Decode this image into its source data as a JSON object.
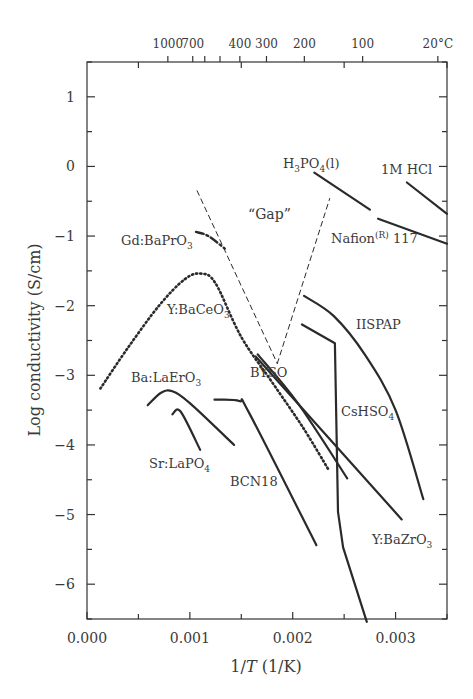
{
  "chart_data": {
    "type": "line",
    "title": "",
    "xlabel": "1/T (1/K)",
    "ylabel": "Log conductivity (S/cm)",
    "xlim": [
      0.0,
      0.0035
    ],
    "ylim": [
      -6.5,
      1.5
    ],
    "x_ticks": [
      "0.000",
      "0.001",
      "0.002",
      "0.003"
    ],
    "x_tick_values": [
      0.0,
      0.001,
      0.002,
      0.003
    ],
    "y_ticks": [
      "1",
      "0",
      "−1",
      "−2",
      "−3",
      "−4",
      "−5",
      "−6"
    ],
    "y_tick_values": [
      1,
      0,
      -1,
      -2,
      -3,
      -4,
      -5,
      -6
    ],
    "top_axis": {
      "label_unit": "°C",
      "ticks": [
        {
          "label": "1000",
          "x": 0.000786
        },
        {
          "label": "700",
          "x": 0.001028
        },
        {
          "label": "",
          "x": 0.001145
        },
        {
          "label": "",
          "x": 0.001293
        },
        {
          "label": "400",
          "x": 0.001486
        },
        {
          "label": "300",
          "x": 0.001745
        },
        {
          "label": "200",
          "x": 0.002113
        },
        {
          "label": "100",
          "x": 0.00268
        },
        {
          "label": "20°C",
          "x": 0.003411
        }
      ]
    },
    "grid": false,
    "legend": "none (inline labels)",
    "series": [
      {
        "name": "1M HCl",
        "style": "solid",
        "x": [
          0.00311,
          0.0035
        ],
        "y": [
          -0.23,
          -0.68
        ]
      },
      {
        "name": "H3PO4(l)",
        "style": "solid",
        "x": [
          0.00221,
          0.00275
        ],
        "y": [
          -0.09,
          -0.62
        ]
      },
      {
        "name": "Nafion(R) 117",
        "style": "solid",
        "x": [
          0.00283,
          0.0035
        ],
        "y": [
          -0.75,
          -1.11
        ]
      },
      {
        "name": "Gd:BaPrO3",
        "style": "dashdot",
        "x": [
          0.00106,
          0.00118,
          0.00134
        ],
        "y": [
          -0.94,
          -1.0,
          -1.18
        ]
      },
      {
        "name": "Y:BaCeO3",
        "style": "dotted",
        "x": [
          0.00013,
          0.0004,
          0.0007,
          0.00095,
          0.00111,
          0.00125,
          0.0015,
          0.0018,
          0.0021,
          0.00235
        ],
        "y": [
          -3.19,
          -2.6,
          -2.0,
          -1.62,
          -1.54,
          -1.68,
          -2.45,
          -3.1,
          -3.75,
          -4.36
        ]
      },
      {
        "name": "Gap boundary (left)",
        "style": "dashed",
        "x": [
          0.00107,
          0.00185
        ],
        "y": [
          -0.35,
          -2.83
        ]
      },
      {
        "name": "Gap boundary (right)",
        "style": "dashed",
        "x": [
          0.00185,
          0.00236
        ],
        "y": [
          -2.83,
          -0.46
        ]
      },
      {
        "name": "IISPAP",
        "style": "solid",
        "x": [
          0.00211,
          0.0024,
          0.0027,
          0.003,
          0.00327
        ],
        "y": [
          -1.86,
          -2.15,
          -2.7,
          -3.5,
          -4.78
        ]
      },
      {
        "name": "CsHSO4",
        "style": "solid",
        "x": [
          0.00209,
          0.00241,
          0.00244,
          0.00249,
          0.00272
        ],
        "y": [
          -2.27,
          -2.54,
          -4.96,
          -5.47,
          -6.54
        ]
      },
      {
        "name": "Y:BaZrO3",
        "style": "solid",
        "x": [
          0.00164,
          0.00306
        ],
        "y": [
          -2.73,
          -5.07
        ]
      },
      {
        "name": "BYSO",
        "style": "solid",
        "x": [
          0.00166,
          0.00205,
          0.00253
        ],
        "y": [
          -2.7,
          -3.4,
          -4.48
        ]
      },
      {
        "name": "Ba:LaErO3",
        "style": "solid",
        "x": [
          0.00059,
          0.00072,
          0.00083,
          0.001,
          0.00143
        ],
        "y": [
          -3.43,
          -3.25,
          -3.23,
          -3.4,
          -4.0
        ]
      },
      {
        "name": "Sr:LaPO4",
        "style": "solid",
        "x": [
          0.00083,
          0.00091,
          0.0011
        ],
        "y": [
          -3.56,
          -3.52,
          -4.07
        ]
      },
      {
        "name": "BCN18",
        "style": "solid",
        "x": [
          0.00124,
          0.00148,
          0.00158,
          0.00223
        ],
        "y": [
          -3.35,
          -3.37,
          -3.55,
          -5.44
        ]
      }
    ],
    "annotations": [
      {
        "text": "“Gap”",
        "x": 0.00155,
        "y": -0.75
      },
      {
        "text": "H3PO4(l)",
        "x": 0.0021,
        "y": 0.05
      },
      {
        "text": "1M HCl",
        "x": 0.0031,
        "y": -0.1
      },
      {
        "text": "Nafion(R) 117",
        "x": 0.0027,
        "y": -1.05
      },
      {
        "text": "Gd:BaPrO3",
        "x": 0.0005,
        "y": -1.05
      },
      {
        "text": "Y:BaCeO3",
        "x": 0.0008,
        "y": -2.1
      },
      {
        "text": "IISPAP",
        "x": 0.0025,
        "y": -2.15
      },
      {
        "text": "BYSO",
        "x": 0.00155,
        "y": -3.1
      },
      {
        "text": "Ba:LaErO3",
        "x": 0.00045,
        "y": -3.25
      },
      {
        "text": "CsHSO4",
        "x": 0.0024,
        "y": -3.75
      },
      {
        "text": "Sr:LaPO4",
        "x": 0.0006,
        "y": -4.15
      },
      {
        "text": "BCN18",
        "x": 0.0011,
        "y": -4.45
      },
      {
        "text": "Y:BaZrO3",
        "x": 0.00285,
        "y": -5.5
      }
    ]
  },
  "labels": {
    "xlabel_main": "1/",
    "xlabel_T": "T",
    "xlabel_unit": " (1/K)",
    "ylabel": "Log conductivity (S/cm)",
    "gap": "“Gap”",
    "h3po4_a": "H",
    "h3po4_sub1": "3",
    "h3po4_b": "PO",
    "h3po4_sub2": "4",
    "h3po4_c": "(l)",
    "hcl": "1M HCl",
    "nafion_a": "Nafion",
    "nafion_sup": "(R)",
    "nafion_b": " 117",
    "gdbapro_a": "Gd:BaPrO",
    "gdbapro_sub": "3",
    "ybaceo_a": "Y:BaCeO",
    "ybaceo_sub": "3",
    "iispap": "IISPAP",
    "byso": "BYSO",
    "balaero_a": "Ba:LaErO",
    "balaero_sub": "3",
    "cshso_a": "CsHSO",
    "cshso_sub": "4",
    "srlapo_a": "Sr:LaPO",
    "srlapo_sub": "4",
    "bcn18": "BCN18",
    "ybazro_a": "Y:BaZrO",
    "ybazro_sub": "3"
  }
}
